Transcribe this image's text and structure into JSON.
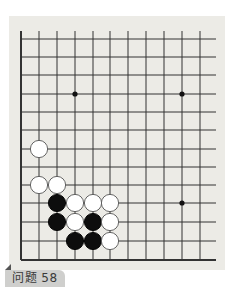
{
  "problem": {
    "label": "问题 58"
  },
  "board": {
    "background": "#ecebe6",
    "line_color": "#333333",
    "columns_x": [
      21,
      39,
      57,
      75,
      93,
      110,
      128,
      146,
      164,
      182,
      200
    ],
    "rows_y": [
      39,
      57,
      75,
      94,
      112,
      130,
      149,
      167,
      185,
      203,
      222,
      241,
      260
    ],
    "line_right_end": 216,
    "line_top_start": 31,
    "edges": [
      "left",
      "bottom"
    ],
    "star_points": [
      {
        "col": 3,
        "row": 3
      },
      {
        "col": 9,
        "row": 3
      },
      {
        "col": 9,
        "row": 9
      }
    ],
    "stones": [
      {
        "color": "white",
        "col": 1,
        "row": 6
      },
      {
        "color": "white",
        "col": 1,
        "row": 8
      },
      {
        "color": "white",
        "col": 2,
        "row": 8
      },
      {
        "color": "black",
        "col": 2,
        "row": 9
      },
      {
        "color": "white",
        "col": 3,
        "row": 9
      },
      {
        "color": "white",
        "col": 4,
        "row": 9
      },
      {
        "color": "white",
        "col": 5,
        "row": 9
      },
      {
        "color": "black",
        "col": 2,
        "row": 10
      },
      {
        "color": "white",
        "col": 3,
        "row": 10
      },
      {
        "color": "black",
        "col": 4,
        "row": 10
      },
      {
        "color": "white",
        "col": 5,
        "row": 10
      },
      {
        "color": "black",
        "col": 3,
        "row": 11
      },
      {
        "color": "black",
        "col": 4,
        "row": 11
      },
      {
        "color": "white",
        "col": 5,
        "row": 11
      }
    ]
  }
}
